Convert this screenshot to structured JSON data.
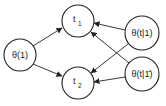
{
  "diagram": {
    "type": "directed-graph",
    "nodes": [
      {
        "id": "t1",
        "label": "t",
        "subscript": "1",
        "cx": 78,
        "cy": 21,
        "r": 16
      },
      {
        "id": "t2",
        "label": "t",
        "subscript": "2",
        "cx": 78,
        "cy": 83,
        "r": 16
      },
      {
        "id": "theta1",
        "label": "θ(1)",
        "cx": 20,
        "cy": 55,
        "r": 16
      },
      {
        "id": "theta_t_1",
        "label": "θ(t|1)",
        "cx": 142,
        "cy": 33,
        "r": 17
      },
      {
        "id": "theta_t_not1",
        "label": "θ(t|1̄)",
        "cx": 142,
        "cy": 74,
        "r": 17
      }
    ],
    "edges": [
      {
        "from": "theta1",
        "to": "t1"
      },
      {
        "from": "theta1",
        "to": "t2"
      },
      {
        "from": "theta_t_1",
        "to": "t1"
      },
      {
        "from": "theta_t_1",
        "to": "t2"
      },
      {
        "from": "theta_t_not1",
        "to": "t1"
      },
      {
        "from": "theta_t_not1",
        "to": "t2"
      }
    ],
    "colors": {
      "stroke": "#222222",
      "background": "#ffffff"
    }
  }
}
